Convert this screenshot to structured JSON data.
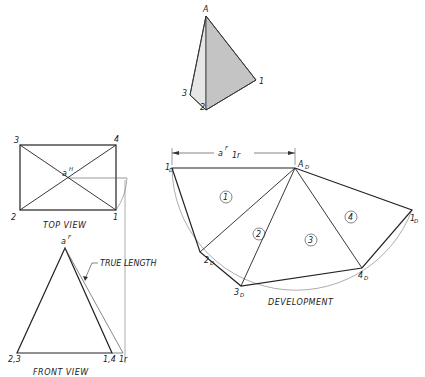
{
  "pictorial": {
    "labels": {
      "apex": "A",
      "v1": "1",
      "v2": "2",
      "v3": "3"
    },
    "colors": {
      "left_face": "#e6e6e6",
      "right_face": "#c4c4c4"
    }
  },
  "top_view": {
    "caption": "TOP VIEW",
    "labels": {
      "v3": "3",
      "v4": "4",
      "v2": "2",
      "v1": "1",
      "apex": "a",
      "apex_sup": "H"
    }
  },
  "front_view": {
    "caption": "FRONT VIEW",
    "labels": {
      "apex": "a",
      "apex_sup": "F",
      "left": "2,3",
      "right": "1,4",
      "revolved": "1r"
    },
    "annotation": "TRUE LENGTH"
  },
  "development": {
    "caption": "DEVELOPMENT",
    "dimension": {
      "main": "a",
      "sup": "F",
      "sub": "1r"
    },
    "labels": {
      "apex": "A",
      "apex_sub": "D",
      "p1a": "1",
      "p1a_sub": "D",
      "p2": "2",
      "p2_sub": "D",
      "p3": "3",
      "p3_sub": "D",
      "p4": "4",
      "p4_sub": "D",
      "p1b": "1",
      "p1b_sub": "D"
    },
    "faces": [
      "1",
      "2",
      "3",
      "4"
    ]
  }
}
